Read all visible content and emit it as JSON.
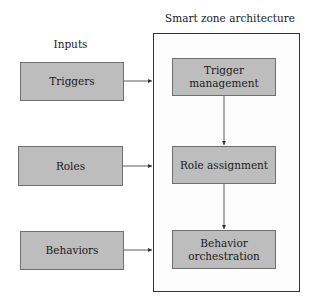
{
  "diagram": {
    "inputs_title": "Inputs",
    "architecture_title": "Smart zone architecture",
    "inputs": [
      {
        "label": "Triggers"
      },
      {
        "label": "Roles"
      },
      {
        "label": "Behaviors"
      }
    ],
    "stages": [
      {
        "line1": "Trigger",
        "line2": "management"
      },
      {
        "line1": "Role assignment",
        "line2": ""
      },
      {
        "line1": "Behavior",
        "line2": "orchestration"
      }
    ],
    "colors": {
      "box_fill": "#bdbdbd",
      "box_border": "#6f6f6f",
      "container_border": "#333333",
      "arrow": "#333333"
    }
  }
}
